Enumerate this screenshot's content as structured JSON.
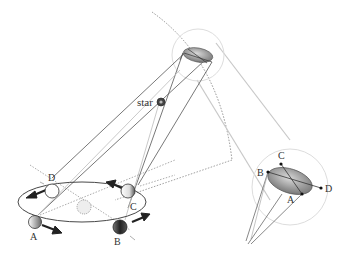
{
  "diagram": {
    "labels": {
      "star": "star",
      "orbit_positions": [
        "A",
        "B",
        "C",
        "D"
      ],
      "inset_positions": [
        "A",
        "B",
        "C",
        "D"
      ]
    },
    "colors": {
      "line": "#555555",
      "light_line": "#c8c8c8",
      "arrow": "#222222",
      "ellipse_fill": "#9a9a9a",
      "sun": "#eeeeee"
    }
  }
}
